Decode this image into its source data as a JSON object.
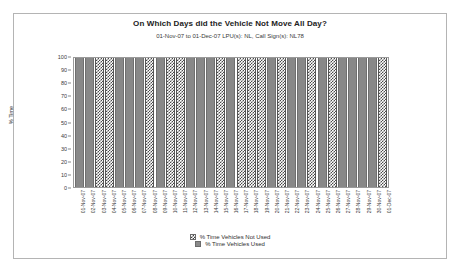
{
  "chart_data": {
    "type": "bar",
    "title": "On Which Days did the Vehicle Not Move All Day?",
    "subtitle": "01-Nov-07 to 01-Dec-07 LPU(s): NL, Call Sign(s): NL78",
    "xlabel": "",
    "ylabel": "% Time",
    "ylim": [
      0,
      100
    ],
    "ytick_labels": [
      "100",
      "90",
      "80",
      "70",
      "60",
      "50",
      "40",
      "30",
      "20",
      "10",
      "0"
    ],
    "ytick_values": [
      100,
      90,
      80,
      70,
      60,
      50,
      40,
      30,
      20,
      10,
      0
    ],
    "grid": false,
    "stacked": true,
    "legend_position": "bottom",
    "categories": [
      "01-Nov-07",
      "02-Nov-07",
      "03-Nov-07",
      "04-Nov-07",
      "05-Nov-07",
      "06-Nov-07",
      "07-Nov-07",
      "08-Nov-07",
      "09-Nov-07",
      "10-Nov-07",
      "11-Nov-07",
      "12-Nov-07",
      "13-Nov-07",
      "14-Nov-07",
      "15-Nov-07",
      "16-Nov-07",
      "17-Nov-07",
      "18-Nov-07",
      "19-Nov-07",
      "20-Nov-07",
      "21-Nov-07",
      "22-Nov-07",
      "23-Nov-07",
      "24-Nov-07",
      "25-Nov-07",
      "26-Nov-07",
      "27-Nov-07",
      "28-Nov-07",
      "29-Nov-07",
      "30-Nov-07",
      "01-Dec-07"
    ],
    "series": [
      {
        "name": "% Time Vehicles Not Used",
        "pattern": "checkerboard",
        "color": "#4a4a4a",
        "values": [
          0,
          0,
          100,
          100,
          0,
          0,
          0,
          100,
          0,
          100,
          100,
          0,
          0,
          0,
          100,
          0,
          100,
          100,
          100,
          0,
          100,
          0,
          0,
          100,
          0,
          100,
          0,
          0,
          0,
          0,
          100
        ]
      },
      {
        "name": "% Time Vehicles Used",
        "pattern": "solid",
        "color": "#888888",
        "values": [
          100,
          100,
          0,
          0,
          100,
          100,
          100,
          0,
          100,
          0,
          0,
          100,
          100,
          100,
          0,
          100,
          0,
          0,
          0,
          100,
          0,
          100,
          100,
          0,
          100,
          0,
          100,
          100,
          100,
          100,
          0
        ]
      }
    ]
  }
}
